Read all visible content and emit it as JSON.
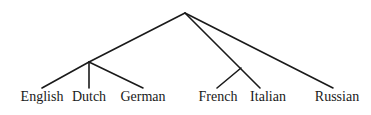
{
  "diagram": {
    "type": "tree",
    "nodes": {
      "root": {
        "x": 185,
        "y": 13
      },
      "germanic": {
        "x": 89,
        "y": 62
      },
      "romance": {
        "x": 241,
        "y": 68
      }
    },
    "leaves": [
      {
        "id": "english",
        "label": "English",
        "x": 42,
        "y": 88
      },
      {
        "id": "dutch",
        "label": "Dutch",
        "x": 89,
        "y": 88
      },
      {
        "id": "german",
        "label": "German",
        "x": 143,
        "y": 88
      },
      {
        "id": "french",
        "label": "French",
        "x": 217,
        "y": 88
      },
      {
        "id": "italian",
        "label": "Italian",
        "x": 260,
        "y": 88
      },
      {
        "id": "russian",
        "label": "Russian",
        "x": 333,
        "y": 88
      }
    ],
    "edges": [
      {
        "from": "root",
        "to": "germanic"
      },
      {
        "from": "germanic",
        "to": "english"
      },
      {
        "from": "germanic",
        "to": "dutch"
      },
      {
        "from": "germanic",
        "to": "german"
      },
      {
        "from": "root",
        "to": "italian"
      },
      {
        "from": "romance",
        "to": "french"
      },
      {
        "from": "root",
        "to": "russian"
      }
    ],
    "line_color": "#1a1a1a",
    "background": "#ffffff"
  }
}
